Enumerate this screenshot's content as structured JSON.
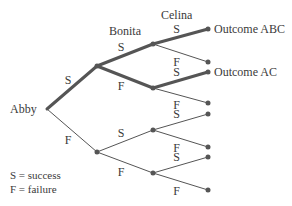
{
  "diagram": {
    "type": "probability-tree",
    "levels": [
      "Abby",
      "Bonita",
      "Celina"
    ],
    "legend": [
      {
        "symbol": "S",
        "text": "S = success"
      },
      {
        "symbol": "F",
        "text": "F = failure"
      }
    ],
    "highlight_color": "#555555",
    "edge_color": "#555555",
    "nodes": {
      "root": {
        "label": "Abby"
      },
      "A_S": {},
      "A_F": {},
      "A_S_B_S": {},
      "A_S_B_F": {},
      "A_F_B_S": {},
      "A_F_B_F": {},
      "leaf_SSS": {
        "label": "Outcome ABC"
      },
      "leaf_SSF": {},
      "leaf_SFS": {
        "label": "Outcome AC"
      },
      "leaf_SFF": {},
      "leaf_FSS": {},
      "leaf_FSF": {},
      "leaf_FFS": {},
      "leaf_FFF": {}
    },
    "edges": [
      {
        "from": "root",
        "to": "A_S",
        "label": "S",
        "highlight": true
      },
      {
        "from": "root",
        "to": "A_F",
        "label": "F",
        "highlight": false
      },
      {
        "from": "A_S",
        "to": "A_S_B_S",
        "label": "S",
        "highlight": true
      },
      {
        "from": "A_S",
        "to": "A_S_B_F",
        "label": "F",
        "highlight": true
      },
      {
        "from": "A_F",
        "to": "A_F_B_S",
        "label": "S",
        "highlight": false
      },
      {
        "from": "A_F",
        "to": "A_F_B_F",
        "label": "F",
        "highlight": false
      },
      {
        "from": "A_S_B_S",
        "to": "leaf_SSS",
        "label": "S",
        "highlight": true
      },
      {
        "from": "A_S_B_S",
        "to": "leaf_SSF",
        "label": "F",
        "highlight": false
      },
      {
        "from": "A_S_B_F",
        "to": "leaf_SFS",
        "label": "S",
        "highlight": true
      },
      {
        "from": "A_S_B_F",
        "to": "leaf_SFF",
        "label": "F",
        "highlight": false
      },
      {
        "from": "A_F_B_S",
        "to": "leaf_FSS",
        "label": "S",
        "highlight": false
      },
      {
        "from": "A_F_B_S",
        "to": "leaf_FSF",
        "label": "F",
        "highlight": false
      },
      {
        "from": "A_F_B_F",
        "to": "leaf_FFS",
        "label": "S",
        "highlight": false
      },
      {
        "from": "A_F_B_F",
        "to": "leaf_FFF",
        "label": "F",
        "highlight": false
      }
    ]
  }
}
